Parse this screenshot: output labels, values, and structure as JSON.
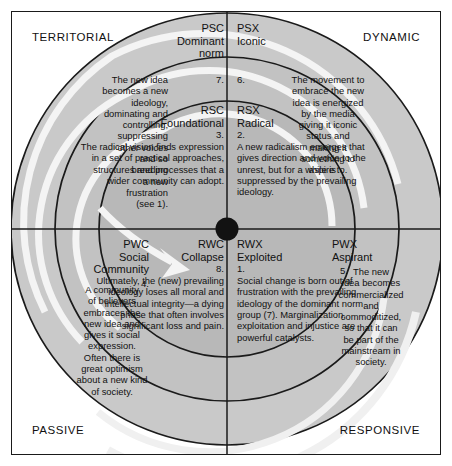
{
  "axes": {
    "top_left": "TERRITORIAL",
    "top_right": "DYNAMIC",
    "bottom_left": "PASSIVE",
    "bottom_right": "RESPONSIVE"
  },
  "colors": {
    "outer_ring_fill": "#c9c9c9",
    "middle_ring_fill": "#bdbdbd",
    "inner_ring_fill": "#b3b3b3",
    "page_background": "#ffffff",
    "stroke": "#1a1a1a",
    "spiral": "#f2f2f2"
  },
  "nodes": {
    "psc": {
      "code": "PSC",
      "name": "Dominant\nnorm",
      "number": "7.",
      "text_lines": [
        "The new idea",
        "becomes a new",
        "ideology,",
        "dominating and",
        "controlling,",
        "suppressing",
        "other voices",
        "and so",
        "breeding",
        "a new",
        "frustration",
        "(see 1)."
      ]
    },
    "psx": {
      "code": "PSX",
      "name": "Iconic",
      "number": "6.",
      "text_lines": [
        "The movement to",
        "embrace the new",
        "idea is energized",
        "by the media",
        "giving it iconic",
        "status and",
        "making it",
        "something to",
        "aspire to."
      ]
    },
    "pwc": {
      "code": "PWC",
      "name": "Social\nCommunity",
      "number": "4.",
      "text_lines": [
        "A community",
        "of believers",
        "embraces the",
        "new idea and",
        "gives it social",
        "expression.",
        "Often there is",
        "great optimism",
        "about a new kind",
        "of society."
      ]
    },
    "pwx": {
      "code": "PWX",
      "name": "Aspirant",
      "number": "5.",
      "text_lines": [
        "The new",
        "idea becomes",
        "commercialized",
        "and",
        "commoditized,",
        "so that it can",
        "be part of the",
        "mainstream in",
        "society."
      ]
    },
    "rsc": {
      "code": "RSC",
      "name": "Foundational",
      "number": "3.",
      "text": "The radical vision finds expression in a set of practical approaches, structures and processes that a wider community can adopt."
    },
    "rsx": {
      "code": "RSX",
      "name": "Radical",
      "number": "2.",
      "text": "A new radicalism emerges that gives direction and voice to the unrest, but for a while is suppressed by the prevailing ideology."
    },
    "rwc": {
      "code": "RWC",
      "name": "Collapse",
      "number": "8.",
      "text": "Ultimately, the (new) prevailing ideology loses all moral and intellectual integrity—a dying phase that often involves significant loss and pain."
    },
    "rwx": {
      "code": "RWX",
      "name": "Exploited",
      "number": "1.",
      "text": "Social change is born out of frustration with the prevailing ideology of the dominant norm group (7). Marginalization, exploitation and injustice are powerful catalysts."
    }
  }
}
